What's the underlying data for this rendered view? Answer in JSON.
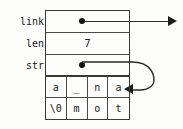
{
  "figure": {
    "kind": "struct-memory-diagram",
    "fields": [
      {
        "name": "link",
        "label": "link",
        "value": "",
        "representation": "pointer-dot-with-arrow"
      },
      {
        "name": "len",
        "label": "len",
        "value": "7",
        "representation": "scalar"
      },
      {
        "name": "str",
        "label": "str",
        "value": "",
        "representation": "pointer-dot-with-curved-arrow"
      }
    ],
    "char_array": {
      "rows": [
        [
          "a",
          "_",
          "n",
          "a"
        ],
        [
          "\\0",
          "m",
          "o",
          "t"
        ]
      ],
      "columns": 4,
      "row_count": 2
    },
    "colors": {
      "ink": "#1a1a1a",
      "border": "#3a3a3a",
      "divider": "#4a4a4a",
      "background": "#fdfdfc"
    }
  }
}
